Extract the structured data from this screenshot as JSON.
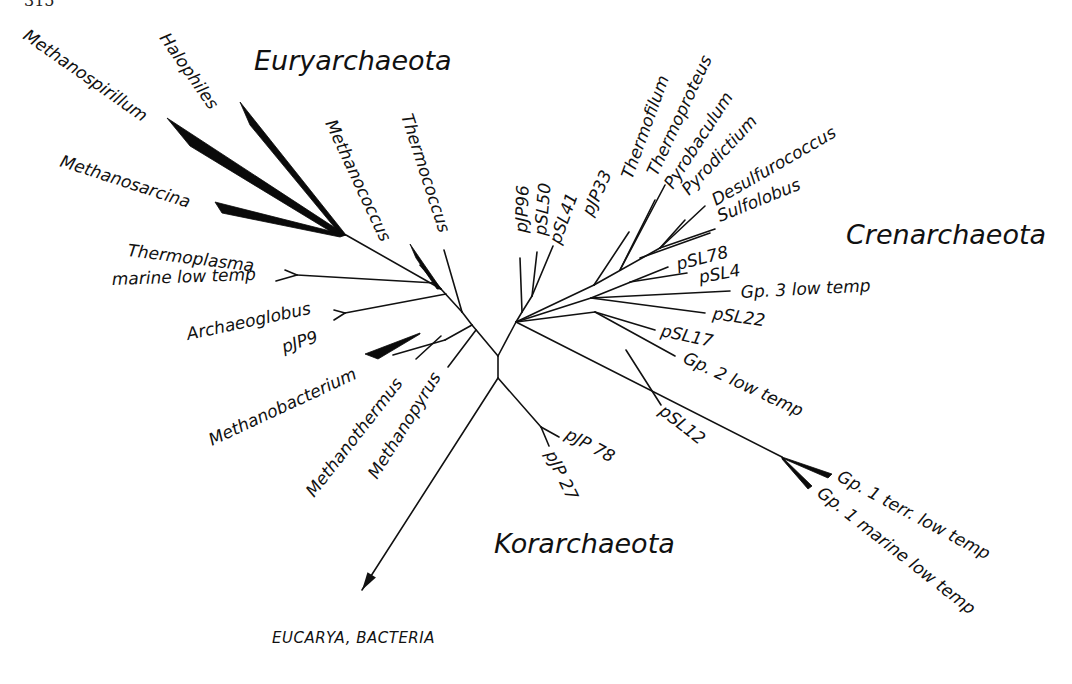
{
  "page_number": "315",
  "groups": [
    {
      "id": "euryarchaeota",
      "label": "Euryarchaeota",
      "x": 254,
      "y": 70,
      "rot": 0
    },
    {
      "id": "crenarchaeota",
      "label": "Crenarchaeota",
      "x": 846,
      "y": 244,
      "rot": 0
    },
    {
      "id": "korarchaeota",
      "label": "Korarchaeota",
      "x": 494,
      "y": 553,
      "rot": 0
    }
  ],
  "outgroup": {
    "label": "EUCARYA, BACTERIA",
    "x": 272,
    "y": 643
  },
  "nodes": {
    "root_top": [
      498,
      356
    ],
    "root_bottom": [
      498,
      378
    ],
    "eury_base": [
      472,
      325
    ],
    "eury_mid": [
      462,
      312
    ],
    "eury_up": [
      441,
      289
    ],
    "eury_up2": [
      420,
      265
    ],
    "eury_crown": [
      346,
      235
    ],
    "cren_base": [
      516,
      322
    ],
    "cren_core": [
      532,
      312
    ],
    "cren_up": [
      556,
      290
    ],
    "cren_crown": [
      594,
      265
    ],
    "cren_crown2": [
      634,
      240
    ],
    "kor_node": [
      541,
      427
    ],
    "gp1_node": [
      782,
      457
    ]
  },
  "branches": [
    {
      "from": [
        498,
        356
      ],
      "to": [
        498,
        378
      ]
    },
    {
      "from": [
        498,
        356
      ],
      "to": [
        472,
        325
      ]
    },
    {
      "from": [
        498,
        356
      ],
      "to": [
        516,
        322
      ]
    },
    {
      "from": [
        498,
        378
      ],
      "to": [
        541,
        427
      ]
    },
    {
      "from": [
        541,
        427
      ],
      "to": [
        559,
        437
      ]
    },
    {
      "from": [
        541,
        427
      ],
      "to": [
        549,
        446
      ]
    },
    {
      "from": [
        472,
        325
      ],
      "to": [
        445,
        340
      ]
    },
    {
      "from": [
        472,
        325
      ],
      "to": [
        462,
        312
      ]
    },
    {
      "from": [
        476,
        330
      ],
      "to": [
        448,
        367
      ]
    },
    {
      "from": [
        462,
        312
      ],
      "to": [
        441,
        289
      ]
    },
    {
      "from": [
        462,
        312
      ],
      "to": [
        444,
        250
      ]
    },
    {
      "from": [
        445,
        340
      ],
      "to": [
        393,
        355
      ]
    },
    {
      "from": [
        441,
        336
      ],
      "to": [
        416,
        359
      ]
    },
    {
      "from": [
        441,
        289
      ],
      "to": [
        346,
        235
      ]
    },
    {
      "from": [
        441,
        289
      ],
      "to": [
        420,
        265
      ]
    },
    {
      "from": [
        435,
        283
      ],
      "to": [
        297,
        275
      ]
    },
    {
      "from": [
        297,
        275
      ],
      "to": [
        285,
        270
      ]
    },
    {
      "from": [
        297,
        275
      ],
      "to": [
        276,
        281
      ]
    },
    {
      "from": [
        446,
        294
      ],
      "to": [
        345,
        313
      ]
    },
    {
      "from": [
        345,
        313
      ],
      "to": [
        334,
        310
      ]
    },
    {
      "from": [
        345,
        313
      ],
      "to": [
        334,
        320
      ]
    },
    {
      "from": [
        516,
        322
      ],
      "to": [
        522,
        312
      ]
    },
    {
      "from": [
        522,
        312
      ],
      "to": [
        520,
        258
      ]
    },
    {
      "from": [
        522,
        312
      ],
      "to": [
        532,
        296
      ]
    },
    {
      "from": [
        532,
        296
      ],
      "to": [
        537,
        252
      ]
    },
    {
      "from": [
        532,
        296
      ],
      "to": [
        553,
        246
      ]
    },
    {
      "from": [
        516,
        322
      ],
      "to": [
        594,
        285
      ]
    },
    {
      "from": [
        594,
        285
      ],
      "to": [
        629,
        232
      ]
    },
    {
      "from": [
        594,
        285
      ],
      "to": [
        660,
        248
      ]
    },
    {
      "from": [
        620,
        270
      ],
      "to": [
        655,
        200
      ]
    },
    {
      "from": [
        620,
        270
      ],
      "to": [
        665,
        185
      ]
    },
    {
      "from": [
        660,
        248
      ],
      "to": [
        685,
        220
      ]
    },
    {
      "from": [
        660,
        248
      ],
      "to": [
        705,
        206
      ]
    },
    {
      "from": [
        660,
        248
      ],
      "to": [
        715,
        229
      ]
    },
    {
      "from": [
        640,
        258
      ],
      "to": [
        710,
        233
      ]
    },
    {
      "from": [
        516,
        322
      ],
      "to": [
        591,
        298
      ]
    },
    {
      "from": [
        591,
        298
      ],
      "to": [
        668,
        267
      ]
    },
    {
      "from": [
        630,
        282
      ],
      "to": [
        687,
        273
      ]
    },
    {
      "from": [
        591,
        298
      ],
      "to": [
        730,
        291
      ]
    },
    {
      "from": [
        591,
        298
      ],
      "to": [
        705,
        313
      ]
    },
    {
      "from": [
        516,
        322
      ],
      "to": [
        595,
        312
      ]
    },
    {
      "from": [
        595,
        312
      ],
      "to": [
        655,
        330
      ]
    },
    {
      "from": [
        595,
        312
      ],
      "to": [
        675,
        356
      ]
    },
    {
      "from": [
        516,
        322
      ],
      "to": [
        782,
        457
      ]
    },
    {
      "from": [
        626,
        350
      ],
      "to": [
        661,
        405
      ]
    }
  ],
  "wedges": [
    {
      "name": "halophiles-wedge",
      "points": [
        [
          346,
          235
        ],
        [
          240,
          102
        ],
        [
          250,
          125
        ],
        [
          340,
          234
        ]
      ]
    },
    {
      "name": "methanospirillum-wedge",
      "points": [
        [
          346,
          235
        ],
        [
          167,
          118
        ],
        [
          190,
          146
        ],
        [
          338,
          236
        ]
      ]
    },
    {
      "name": "methanosarcina-wedge",
      "points": [
        [
          346,
          235
        ],
        [
          215,
          202
        ],
        [
          222,
          213
        ],
        [
          340,
          237
        ]
      ]
    },
    {
      "name": "methanococcus-wedge",
      "points": [
        [
          441,
          289
        ],
        [
          410,
          244
        ],
        [
          416,
          258
        ],
        [
          437,
          289
        ]
      ]
    },
    {
      "name": "methanobacterium-wedge",
      "points": [
        [
          420,
          333
        ],
        [
          365,
          354
        ],
        [
          378,
          359
        ],
        [
          420,
          334
        ]
      ]
    },
    {
      "name": "gp1-terr-wedge",
      "points": [
        [
          782,
          457
        ],
        [
          832,
          474
        ],
        [
          828,
          478
        ],
        [
          782,
          458
        ]
      ]
    },
    {
      "name": "gp1-marine-wedge",
      "points": [
        [
          782,
          457
        ],
        [
          812,
          486
        ],
        [
          808,
          489
        ],
        [
          782,
          459
        ]
      ]
    }
  ],
  "outgroup_arrow": {
    "from": [
      498,
      378
    ],
    "to": [
      362,
      590
    ]
  },
  "taxa": [
    {
      "id": "methanospirillum",
      "label": "Methanospirillum",
      "x": 22,
      "y": 38,
      "rot": 35
    },
    {
      "id": "halophiles",
      "label": "Halophiles",
      "x": 159,
      "y": 38,
      "rot": 55
    },
    {
      "id": "methanosarcina",
      "label": "Methanosarcina",
      "x": 59,
      "y": 166,
      "rot": 18
    },
    {
      "id": "thermoplasma",
      "label": "Thermoplasma",
      "x": 127,
      "y": 256,
      "rot": 7
    },
    {
      "id": "thermoplasma-marine",
      "label": "marine low temp",
      "x": 112,
      "y": 285,
      "rot": -2
    },
    {
      "id": "archaeoglobus",
      "label": "Archaeoglobus",
      "x": 188,
      "y": 340,
      "rot": -12
    },
    {
      "id": "pjp9",
      "label": "pJP9",
      "x": 284,
      "y": 353,
      "rot": -18
    },
    {
      "id": "methanobacterium",
      "label": "Methanobacterium",
      "x": 212,
      "y": 446,
      "rot": -25
    },
    {
      "id": "methanothermus",
      "label": "Methanothermus",
      "x": 314,
      "y": 498,
      "rot": -52
    },
    {
      "id": "methanopyrus",
      "label": "Methanopyrus",
      "x": 377,
      "y": 480,
      "rot": -58
    },
    {
      "id": "methanococcus",
      "label": "Methanococcus",
      "x": 325,
      "y": 123,
      "rot": 65
    },
    {
      "id": "thermococcus",
      "label": "Thermococcus",
      "x": 401,
      "y": 116,
      "rot": 72
    },
    {
      "id": "pjp96",
      "label": "pJP96",
      "x": 527,
      "y": 233,
      "rot": -88
    },
    {
      "id": "psl50",
      "label": "pSL50",
      "x": 546,
      "y": 236,
      "rot": -85
    },
    {
      "id": "psl41",
      "label": "pSL41",
      "x": 560,
      "y": 245,
      "rot": -70
    },
    {
      "id": "pjp33",
      "label": "pJP33",
      "x": 592,
      "y": 217,
      "rot": -65
    },
    {
      "id": "thermofilum",
      "label": "Thermofilum",
      "x": 632,
      "y": 180,
      "rot": -70
    },
    {
      "id": "thermoproteus",
      "label": "Thermoproteus",
      "x": 657,
      "y": 177,
      "rot": -65
    },
    {
      "id": "pyrobaculum",
      "label": "Pyrobaculum",
      "x": 673,
      "y": 190,
      "rot": -57
    },
    {
      "id": "pyrodictium",
      "label": "Pyrodictium",
      "x": 689,
      "y": 196,
      "rot": -47
    },
    {
      "id": "desulfurococcus",
      "label": "Desulfurococcus",
      "x": 716,
      "y": 206,
      "rot": -30
    },
    {
      "id": "sulfolobus",
      "label": "Sulfolobus",
      "x": 720,
      "y": 222,
      "rot": -22
    },
    {
      "id": "psl78",
      "label": "pSL78",
      "x": 678,
      "y": 270,
      "rot": -14
    },
    {
      "id": "psl4",
      "label": "pSL4",
      "x": 700,
      "y": 283,
      "rot": -10
    },
    {
      "id": "gp3",
      "label": "Gp. 3 low temp",
      "x": 741,
      "y": 298,
      "rot": -3
    },
    {
      "id": "psl22",
      "label": "pSL22",
      "x": 712,
      "y": 319,
      "rot": 8
    },
    {
      "id": "psl17",
      "label": "pSL17",
      "x": 660,
      "y": 336,
      "rot": 12
    },
    {
      "id": "gp2",
      "label": "Gp. 2 low temp",
      "x": 682,
      "y": 362,
      "rot": 25
    },
    {
      "id": "psl12",
      "label": "pSL12",
      "x": 658,
      "y": 413,
      "rot": 38
    },
    {
      "id": "pjp78",
      "label": "pJP 78",
      "x": 564,
      "y": 438,
      "rot": 28
    },
    {
      "id": "pjp27",
      "label": "pJP 27",
      "x": 545,
      "y": 454,
      "rot": 64
    },
    {
      "id": "gp1-terr",
      "label": "Gp. 1 terr. low temp",
      "x": 836,
      "y": 480,
      "rot": 28
    },
    {
      "id": "gp1-marine",
      "label": "Gp. 1 marine low temp",
      "x": 816,
      "y": 495,
      "rot": 38
    }
  ]
}
